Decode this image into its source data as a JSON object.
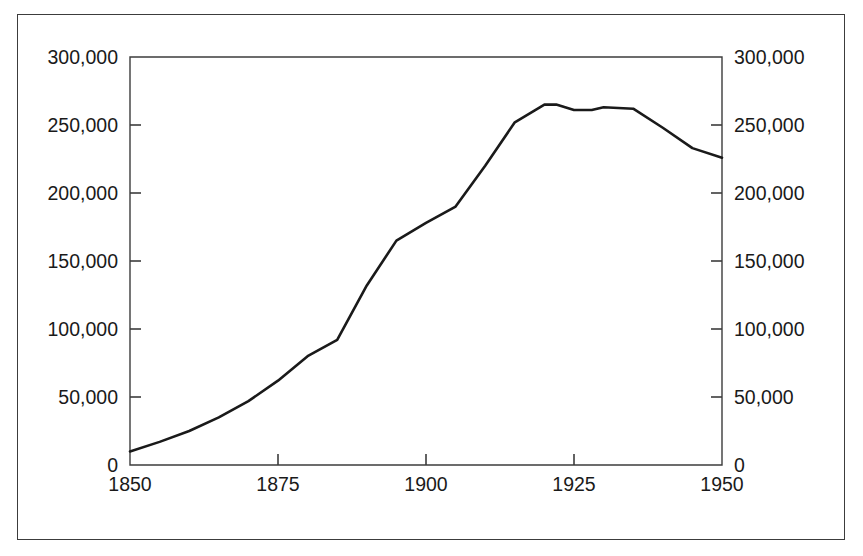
{
  "chart_data": {
    "type": "line",
    "title": "",
    "subtitle": "",
    "xlabel": "",
    "ylabel": "",
    "xlim": [
      1850,
      1950
    ],
    "ylim": [
      0,
      300000
    ],
    "grid": false,
    "legend": null,
    "legend_position": "none",
    "dual_y_axis": true,
    "x_ticks": [
      1850,
      1875,
      1900,
      1925,
      1950
    ],
    "x_tick_labels": [
      "1850",
      "1875",
      "1900",
      "1925",
      "1950"
    ],
    "y_ticks": [
      0,
      50000,
      100000,
      150000,
      200000,
      250000,
      300000
    ],
    "y_tick_labels_left": [
      "0",
      "50,000",
      "100,000",
      "150,000",
      "200,000",
      "250,000",
      "300,000"
    ],
    "y_tick_labels_right": [
      "0",
      "50,000",
      "100,000",
      "150,000",
      "200,000",
      "250,000",
      "300,000"
    ],
    "series": [
      {
        "name": "value",
        "color": "#1a1a1a",
        "line_width": 2.6,
        "x": [
          1850,
          1855,
          1860,
          1865,
          1870,
          1875,
          1880,
          1885,
          1890,
          1895,
          1900,
          1905,
          1910,
          1915,
          1920,
          1922,
          1925,
          1928,
          1930,
          1935,
          1940,
          1945,
          1950
        ],
        "y": [
          10000,
          17000,
          25000,
          35000,
          47000,
          62000,
          80000,
          92000,
          132000,
          165000,
          178000,
          190000,
          220000,
          252000,
          265000,
          265000,
          261000,
          261000,
          263000,
          262000,
          248000,
          233000,
          226000
        ]
      }
    ]
  },
  "axes": {
    "left_axis_label": "",
    "right_axis_label": "",
    "bottom_axis_label": ""
  },
  "colors": {
    "line": "#1a1a1a",
    "axis": "#3c3c3c",
    "frame": "#3c3c3c",
    "text": "#1a1a1a",
    "background": "#ffffff"
  }
}
